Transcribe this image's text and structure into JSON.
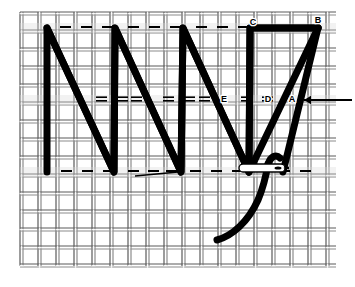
{
  "figure": {
    "background_color": "#ffffff",
    "stitch_color": "#000000",
    "mesh_color": "#8c8c8c",
    "mesh_color_dark": "#5a5a5a"
  },
  "mesh": {
    "name": "canvas-grid",
    "left": 20,
    "top": 12,
    "right": 336,
    "bottom": 266,
    "cell_size": 18,
    "columns": 18,
    "rows": 14,
    "thread_pair_gap": 3,
    "thread_width": 1.2
  },
  "guide_rows": {
    "top_y": 28,
    "middle_y": 100,
    "bottom_y": 172
  },
  "stitch_path": {
    "type": "zigzag-herringbone",
    "stroke_width": 7,
    "top_vertices_x": [
      47,
      115,
      183,
      250,
      318
    ],
    "bottom_vertices_x": [
      47,
      114,
      181,
      249
    ],
    "middle_crossings_x": [
      81,
      148,
      216,
      283
    ],
    "note": "Long diagonals run from the bottom guide line up to the top guide line and back, crossing at the middle line."
  },
  "labels": [
    {
      "id": "label-c",
      "text": "C",
      "x": 253,
      "y": 25,
      "anchor": "middle"
    },
    {
      "id": "label-b",
      "text": "B",
      "x": 318,
      "y": 23,
      "anchor": "middle"
    },
    {
      "id": "label-e",
      "text": "E",
      "x": 224,
      "y": 102,
      "anchor": "middle"
    },
    {
      "id": "label-d",
      "text": "D",
      "x": 268,
      "y": 102,
      "anchor": "middle"
    },
    {
      "id": "label-a",
      "text": "A",
      "x": 292,
      "y": 102,
      "anchor": "middle"
    }
  ],
  "dashes": {
    "top_row": {
      "y": 27,
      "style": "single",
      "x_positions": [
        60,
        81,
        102,
        128,
        149,
        170,
        196,
        217,
        238,
        264,
        285,
        306
      ]
    },
    "middle_row": {
      "y": 99,
      "style": "double",
      "gap": 3,
      "x_positions": [
        96,
        117,
        131,
        163,
        184,
        199,
        241,
        262
      ]
    },
    "bottom_row": {
      "y": 171,
      "style": "single",
      "x_positions": [
        61,
        82,
        103,
        128,
        148,
        166,
        190,
        211,
        232,
        258,
        279,
        300
      ]
    },
    "dash_length": 11,
    "dash_thickness": 2
  },
  "loose_thread": {
    "name": "loose-thread-line",
    "x1": 135,
    "y1": 176,
    "x2": 178,
    "y2": 172,
    "thickness": 1.6
  },
  "needle": {
    "name": "sewing-needle",
    "center_x": 262,
    "center_y": 168,
    "length": 46,
    "height": 8,
    "eye_x": 278,
    "eye_width": 7,
    "eye_height": 3.2,
    "orientation": "horizontal",
    "fill": "#ffffff",
    "outline": "#000000"
  },
  "working_thread": {
    "name": "working-thread",
    "stroke_width": 7,
    "path": "M 217 240 C 232 236, 248 222, 258 200 C 264 186, 266 176, 268 164",
    "tail_tip": "M 268 164 C 271 156, 276 154, 280 158"
  },
  "direction_arrow": {
    "name": "direction-arrow",
    "points_to": "left",
    "tip_x": 304,
    "tail_x": 352,
    "y": 100,
    "thickness": 1.8,
    "head_size": 7
  }
}
